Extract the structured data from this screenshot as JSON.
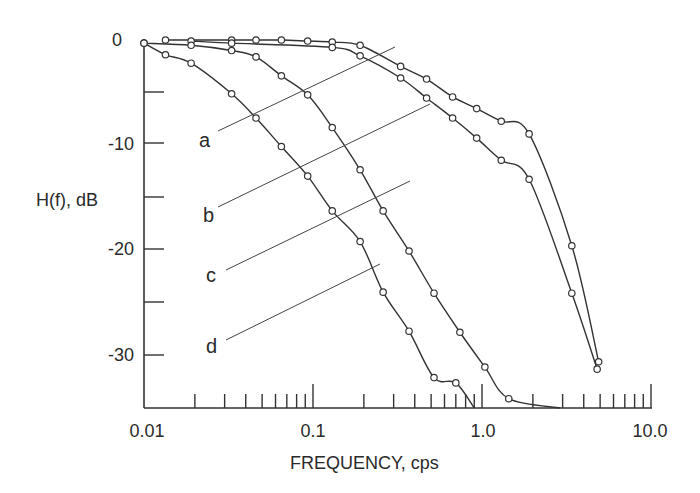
{
  "chart_data": {
    "type": "line",
    "title": "",
    "xlabel": "FREQUENCY, cps",
    "ylabel": "H(f), dB",
    "xscale": "log",
    "xlim": [
      0.01,
      10.0
    ],
    "ylim": [
      -35,
      0
    ],
    "x_tick_labels": [
      "0.01",
      "0.1",
      "1.0",
      "10.0"
    ],
    "y_tick_labels": [
      "0",
      "-10",
      "-20",
      "-30"
    ],
    "grid": false,
    "legend": "curve labels a, b, c, d with leader lines",
    "series": [
      {
        "name": "a",
        "x": [
          0.0134,
          0.033,
          0.046,
          0.065,
          0.093,
          0.13,
          0.19,
          0.33,
          0.47,
          0.67,
          0.93,
          1.3,
          1.9,
          3.4,
          4.9
        ],
        "y": [
          0.0,
          0.0,
          0.0,
          0.0,
          -0.1,
          -0.2,
          -0.5,
          -2.5,
          -3.7,
          -5.4,
          -6.5,
          -7.7,
          -8.9,
          -19.5,
          -30.5
        ],
        "markers": true
      },
      {
        "name": "b",
        "x": [
          0.019,
          0.033,
          0.13,
          0.19,
          0.33,
          0.47,
          0.67,
          0.93,
          1.3,
          1.9,
          3.4,
          4.8
        ],
        "y": [
          -0.1,
          -0.3,
          -0.7,
          -1.5,
          -3.6,
          -5.5,
          -7.4,
          -9.3,
          -11.4,
          -13.2,
          -24.0,
          -31.2
        ],
        "markers": true
      },
      {
        "name": "c",
        "x": [
          0.01,
          0.019,
          0.033,
          0.046,
          0.065,
          0.093,
          0.13,
          0.19,
          0.26,
          0.37,
          0.52,
          0.74,
          1.04,
          1.44,
          2.9
        ],
        "y": [
          -0.3,
          -0.5,
          -1.0,
          -1.6,
          -3.4,
          -5.2,
          -8.3,
          -12.3,
          -16.2,
          -20.0,
          -24.0,
          -27.7,
          -31.0,
          -34.0,
          -35.0
        ],
        "markers": true
      },
      {
        "name": "d",
        "x": [
          0.01,
          0.0134,
          0.019,
          0.033,
          0.046,
          0.065,
          0.093,
          0.13,
          0.19,
          0.26,
          0.37,
          0.52,
          0.7,
          0.9
        ],
        "y": [
          -0.3,
          -1.4,
          -2.2,
          -5.1,
          -7.4,
          -10.1,
          -12.9,
          -16.2,
          -19.1,
          -23.9,
          -27.6,
          -32.0,
          -32.5,
          -35.0
        ],
        "markers": true
      }
    ]
  },
  "labels": {
    "ylabel": "H(f), dB",
    "xlabel": "FREQUENCY, cps",
    "yticks": [
      "0",
      "-10",
      "-20",
      "-30"
    ],
    "xticks": [
      "0.01",
      "0.1",
      "1.0",
      "10.0"
    ],
    "curves": [
      "a",
      "b",
      "c",
      "d"
    ]
  }
}
